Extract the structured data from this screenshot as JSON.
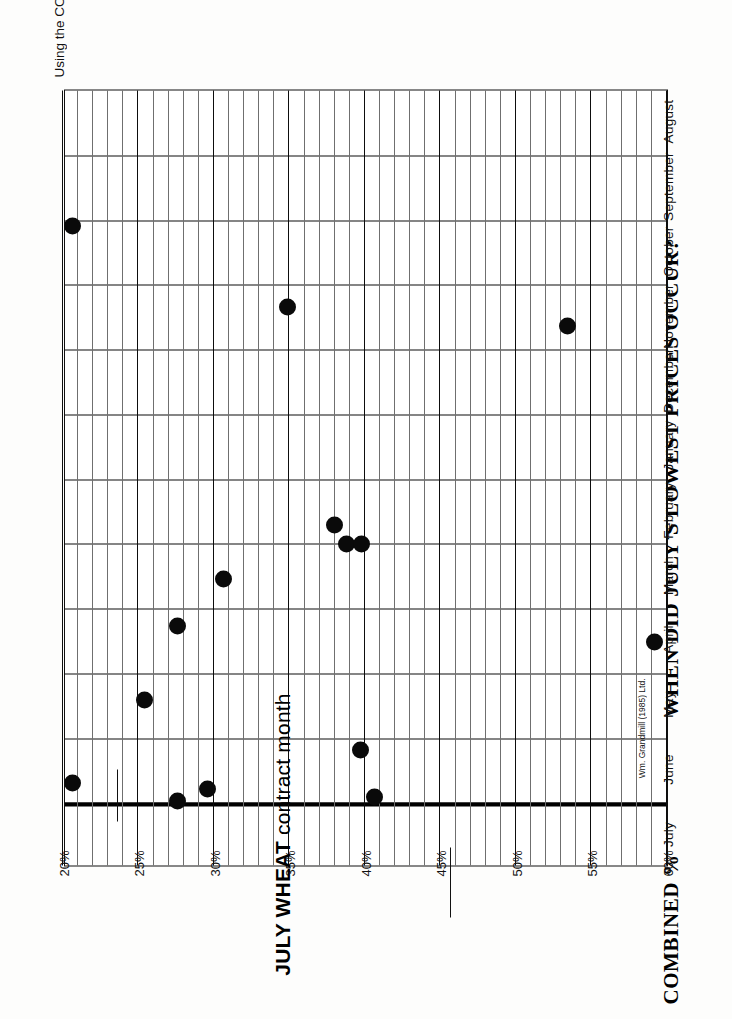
{
  "header": {
    "axis_title": "COMBINED %",
    "main_title": "WHEN DID JULY'S LOWEST PRICES OCCUR?",
    "subtitle": "Using the COMBINATION CARRYOVER (60% World plus 40% U.S. carryovers)",
    "contract_note_bold": "JULY WHEAT",
    "contract_note_rest": " contract month",
    "credit": "Wm. Grandmill (1985) Ltd."
  },
  "colors": {
    "ink": "#0a0a0a",
    "grid_minor": "#6f6f6f",
    "grid_major": "#0d0d0d",
    "paper": "#ffffff"
  },
  "chart_data": {
    "type": "scatter",
    "title": "WHEN DID JULY'S LOWEST PRICES OCCUR?",
    "subtitle": "Using the COMBINATION CARRYOVER (60% World plus 40% U.S. carryovers)",
    "xlabel": "",
    "ylabel": "COMBINED %",
    "grid": true,
    "legend": "none",
    "categories": [
      "August",
      "September",
      "October",
      "November",
      "December",
      "January",
      "February",
      "March",
      "April",
      "May",
      "June",
      "July"
    ],
    "ylim": [
      20,
      60
    ],
    "ytick_labels": [
      "20%",
      "25%",
      "30%",
      "35%",
      "40%",
      "45%",
      "50%",
      "55%",
      "60%"
    ],
    "ytick_values": [
      20,
      25,
      30,
      35,
      40,
      45,
      50,
      55,
      60
    ],
    "y_minor_step": 1,
    "points": [
      {
        "month": "October",
        "month_index": 2,
        "month_frac": 0.1,
        "percent": 20.6
      },
      {
        "month": "November",
        "month_index": 3,
        "month_frac": 0.34,
        "percent": 34.9
      },
      {
        "month": "November",
        "month_index": 3,
        "month_frac": 0.63,
        "percent": 53.4
      },
      {
        "month": "February",
        "month_index": 6,
        "month_frac": 0.71,
        "percent": 38.0
      },
      {
        "month": "February",
        "month_index": 6,
        "month_frac": 1.0,
        "percent": 38.8
      },
      {
        "month": "March",
        "month_index": 7,
        "month_frac": 0.0,
        "percent": 39.8
      },
      {
        "month": "March",
        "month_index": 7,
        "month_frac": 0.55,
        "percent": 30.6
      },
      {
        "month": "April",
        "month_index": 8,
        "month_frac": 0.27,
        "percent": 27.6
      },
      {
        "month": "April",
        "month_index": 8,
        "month_frac": 0.52,
        "percent": 59.2
      },
      {
        "month": "May",
        "month_index": 9,
        "month_frac": 0.42,
        "percent": 25.4
      },
      {
        "month": "June",
        "month_index": 10,
        "month_frac": 0.18,
        "percent": 39.7
      },
      {
        "month": "June",
        "month_index": 10,
        "month_frac": 0.7,
        "percent": 20.6
      },
      {
        "month": "June",
        "month_index": 10,
        "month_frac": 0.79,
        "percent": 29.6
      },
      {
        "month": "June",
        "month_index": 10,
        "month_frac": 0.91,
        "percent": 40.6
      },
      {
        "month": "June",
        "month_index": 10,
        "month_frac": 0.98,
        "percent": 27.6
      }
    ],
    "annotations": [
      {
        "text": "JULY WHEAT contract month",
        "at_month": "July"
      },
      {
        "text": "Wm. Grandmill (1985) Ltd.",
        "at_month": "May"
      }
    ]
  }
}
